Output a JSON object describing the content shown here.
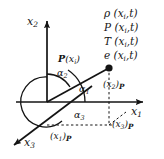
{
  "figure": {
    "background_color": "#ffffff",
    "line_color": "#141414"
  },
  "axes": [
    {
      "name": "x2-axis",
      "label_x": "x",
      "label_sub": "2"
    },
    {
      "name": "x1-axis",
      "label_x": "x",
      "label_sub": "1"
    },
    {
      "name": "x3-axis",
      "label_x": "x",
      "label_sub": "3"
    }
  ],
  "axis_labels": {
    "x2": {
      "base": "x",
      "sub": "2"
    },
    "x1": {
      "base": "x",
      "sub": "1"
    },
    "x3": {
      "base": "x",
      "sub": "3"
    }
  },
  "point": {
    "name": "point-P",
    "label_p": "P",
    "label_args": "(x",
    "label_sub": "i",
    "label_close": ")"
  },
  "angles": [
    {
      "name": "alpha-1",
      "text": "α",
      "sub": "1"
    },
    {
      "name": "alpha-2",
      "text": "α",
      "sub": "2"
    },
    {
      "name": "alpha-3",
      "text": "α",
      "sub": "3"
    }
  ],
  "projections": [
    {
      "name": "projection-x1",
      "open": "(x",
      "sub": "1",
      "close": ")",
      "subscript_p": "P"
    },
    {
      "name": "projection-x2",
      "open": "(x",
      "sub": "2",
      "close": ")",
      "subscript_p": "P"
    },
    {
      "name": "projection-x3",
      "open": "(x",
      "sub": "3",
      "close": ")",
      "subscript_p": "P"
    }
  ],
  "field_variables": [
    {
      "name": "density-field",
      "symbol": "ρ",
      "args_open": "(x",
      "sub": "i",
      "args_close": ",t)"
    },
    {
      "name": "pressure-field",
      "symbol": "P",
      "args_open": "(x",
      "sub": "i",
      "args_close": ",t)"
    },
    {
      "name": "temperature-field",
      "symbol": "T",
      "args_open": "(x",
      "sub": "i",
      "args_close": ",t)"
    },
    {
      "name": "energy-field",
      "symbol": "e",
      "args_open": "(x",
      "sub": "i",
      "args_close": ",t)"
    }
  ]
}
